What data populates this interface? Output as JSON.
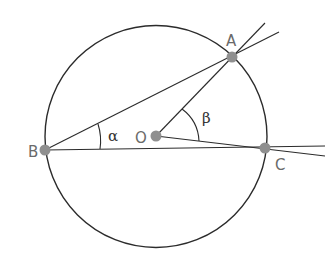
{
  "diagram": {
    "points": [
      {
        "id": "A",
        "label": "A"
      },
      {
        "id": "B",
        "label": "B"
      },
      {
        "id": "C",
        "label": "C"
      },
      {
        "id": "O",
        "label": "O"
      }
    ],
    "angles": [
      {
        "id": "alpha",
        "label": "α",
        "vertex": "B",
        "between": [
          "A",
          "C"
        ]
      },
      {
        "id": "beta",
        "label": "β",
        "vertex": "O",
        "between": [
          "A",
          "C"
        ]
      }
    ],
    "segments": [
      {
        "from": "B",
        "to": "A",
        "extended": true
      },
      {
        "from": "B",
        "to": "C",
        "extended": true
      },
      {
        "from": "O",
        "to": "A",
        "extended": true
      },
      {
        "from": "O",
        "to": "C",
        "extended": true
      }
    ],
    "colors": {
      "stroke": "#2b2b2b",
      "point": "#8f8f8f",
      "label": "#6a6a6a"
    }
  }
}
